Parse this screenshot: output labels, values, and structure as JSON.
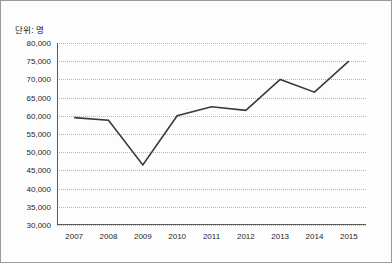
{
  "unit_label": "단위: 명",
  "colors": {
    "line": "#3a3a3a",
    "grid": "#b6b6b6",
    "axis": "#5a5a5a",
    "border": "#9a9a9a",
    "background": "#fdfdfd",
    "text": "#1f1f1f"
  },
  "chart_data": {
    "type": "line",
    "title": "",
    "subtitle": "",
    "xlabel": "",
    "ylabel": "단위: 명",
    "categories": [
      "2007",
      "2008",
      "2009",
      "2010",
      "2011",
      "2012",
      "2013",
      "2014",
      "2015"
    ],
    "values": [
      59500,
      58800,
      46500,
      60000,
      62500,
      61500,
      70000,
      66500,
      75000
    ],
    "series": [
      {
        "name": "인원",
        "values": [
          59500,
          58800,
          46500,
          60000,
          62500,
          61500,
          70000,
          66500,
          75000
        ]
      }
    ],
    "ylim": [
      30000,
      80000
    ],
    "ytick_step": 5000,
    "ytick_labels": [
      "80,000",
      "75,000",
      "70,000",
      "65,000",
      "60,000",
      "55,000",
      "50,000",
      "45,000",
      "40,000",
      "35,000",
      "30,000"
    ],
    "ytick_values": [
      80000,
      75000,
      70000,
      65000,
      60000,
      55000,
      50000,
      45000,
      40000,
      35000,
      30000
    ],
    "grid": true,
    "grid_style": "dotted-horizontal",
    "legend": false,
    "legend_position": "none",
    "markers": false
  }
}
